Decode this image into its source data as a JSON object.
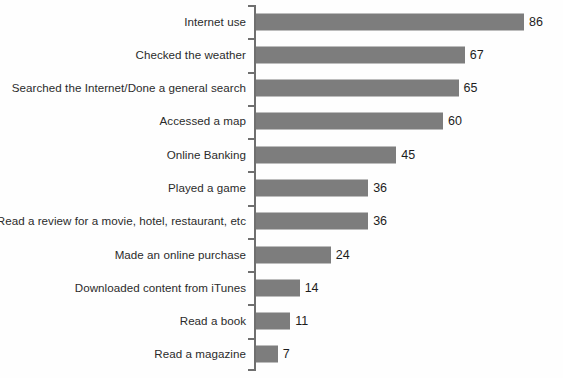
{
  "chart_data": {
    "type": "bar",
    "orientation": "horizontal",
    "title": "",
    "subtitle": "",
    "xlabel": "",
    "ylabel": "",
    "xlim": [
      0,
      86
    ],
    "grid": false,
    "legend": false,
    "bar_color": "#7d7d7d",
    "background_color": "#fefefe",
    "value_labels": true,
    "categories": [
      "Internet use",
      "Checked the weather",
      "Searched the Internet/Done a general search",
      "Accessed a map",
      "Online Banking",
      "Played a game",
      "Read a review for a movie, hotel, restaurant, etc",
      "Made an online purchase",
      "Downloaded content from iTunes",
      "Read a book",
      "Read a magazine"
    ],
    "values": [
      86,
      67,
      65,
      60,
      45,
      36,
      36,
      24,
      14,
      11,
      7
    ],
    "value_text": [
      "86",
      "67",
      "65",
      "60",
      "45",
      "36",
      "36",
      "24",
      "14",
      "11",
      "7"
    ]
  },
  "axis": {
    "tick_count": 12,
    "spine_color": "#6f6f6f"
  }
}
